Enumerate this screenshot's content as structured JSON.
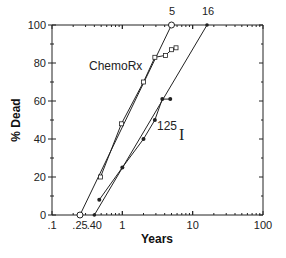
{
  "chart_data": {
    "type": "line",
    "title": "",
    "xlabel": "Years",
    "ylabel": "% Dead",
    "xscale": "log",
    "xlim": [
      0.1,
      100
    ],
    "ylim": [
      0,
      100
    ],
    "x_tick_labels": [
      ".1",
      ".25",
      ".40",
      "1",
      "10",
      "100"
    ],
    "x_tick_values": [
      0.1,
      0.25,
      0.4,
      1,
      10,
      100
    ],
    "y_tick_labels": [
      "0",
      "20",
      "40",
      "60",
      "80",
      "100"
    ],
    "y_tick_values": [
      0,
      20,
      40,
      60,
      80,
      100
    ],
    "top_annotations": [
      {
        "label": "5",
        "x": 5,
        "y": 100
      },
      {
        "label": "16",
        "x": 16,
        "y": 100
      }
    ],
    "grid": false,
    "series": [
      {
        "name": "ChemoRx",
        "marker": "open-square",
        "x": [
          0.49,
          0.97,
          2.0,
          2.9,
          4.1,
          5.0,
          5.8
        ],
        "y": [
          20,
          48,
          70,
          83,
          84,
          87,
          88
        ],
        "fit_line": {
          "x": [
            0.25,
            5
          ],
          "y": [
            0,
            100
          ]
        }
      },
      {
        "name": "125 I",
        "marker": "filled-circle",
        "x": [
          0.47,
          1.0,
          2.0,
          2.9,
          3.7,
          4.8
        ],
        "y": [
          8,
          25,
          40,
          50,
          61,
          61
        ],
        "fit_line": {
          "x": [
            0.4,
            16
          ],
          "y": [
            0,
            100
          ]
        }
      }
    ],
    "legend": "inline labels"
  },
  "labels": {
    "chemo": "ChemoRx",
    "iodine_mass": "125",
    "iodine_symbol": "I",
    "xlabel": "Years",
    "ylabel": "% Dead",
    "top5": "5",
    "top16": "16"
  }
}
